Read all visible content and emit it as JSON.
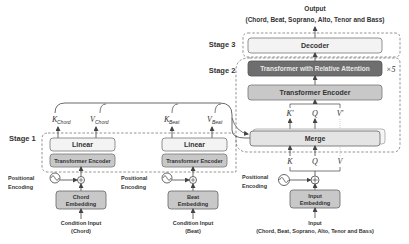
{
  "output": {
    "title": "Output",
    "subtitle": "(Chord, Beat, Soprano, Alto, Tenor and Bass)"
  },
  "stages": {
    "stage1": "Stage 1",
    "stage2": "Stage 2",
    "stage3": "Stage 3"
  },
  "stage3": {
    "decoder": "Decoder"
  },
  "stage2": {
    "relative_attention": "Transformer with Relative Attention",
    "repeat": "×5",
    "encoder": "Transformer Encoder",
    "merge": "Merge",
    "kprime": "K'",
    "q_top": "Q",
    "vprime": "V'",
    "k": "K",
    "q": "Q",
    "v": "V"
  },
  "chord_branch": {
    "k_main": "K",
    "k_sub": "Chord",
    "v_main": "V",
    "v_sub": "Chord",
    "linear": "Linear",
    "encoder": "Transformer Encoder",
    "pe_line1": "Positional",
    "pe_line2": "Encoding",
    "embed_line1": "Chord",
    "embed_line2": "Embedding",
    "input_line1": "Condition Input",
    "input_line2": "(Chord)"
  },
  "beat_branch": {
    "k_main": "K",
    "k_sub": "Beat",
    "v_main": "V",
    "v_sub": "Beat",
    "linear": "Linear",
    "encoder": "Transformer Encoder",
    "pe_line1": "Positional",
    "pe_line2": "Encoding",
    "embed_line1": "Beat",
    "embed_line2": "Embedding",
    "input_line1": "Condition Input",
    "input_line2": "(Beat)"
  },
  "main_input": {
    "pe_line1": "Positional",
    "pe_line2": "Encoding",
    "embed_line1": "Input",
    "embed_line2": "Embedding",
    "input_line1": "Input",
    "input_line2": "(Chord, Beat, Soprano, Alto, Tenor and Bass)"
  },
  "colors": {
    "light_box": "#f3f3f3",
    "mid_box": "#c8c8c8",
    "dark_box": "#6e6e6e",
    "stroke": "#555555",
    "dashed": "#666666"
  }
}
